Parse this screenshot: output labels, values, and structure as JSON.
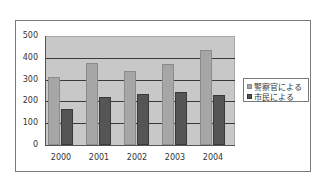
{
  "chart_data": {
    "type": "bar",
    "title": "",
    "xlabel": "",
    "ylabel": "",
    "categories": [
      "2000",
      "2001",
      "2002",
      "2003",
      "2004"
    ],
    "series": [
      {
        "name": "警察官による",
        "color": "#a6a6a6",
        "values": [
          310,
          375,
          340,
          373,
          435
        ]
      },
      {
        "name": "市民による",
        "color": "#555555",
        "values": [
          165,
          222,
          233,
          245,
          230
        ]
      }
    ],
    "ylim": [
      0,
      500
    ],
    "yticks": [
      "0",
      "100",
      "200",
      "300",
      "400",
      "500"
    ],
    "grid": true,
    "legend_position": "right",
    "plot_background": "#c8c8c8"
  },
  "legend": {
    "items": [
      {
        "label": "警察官による"
      },
      {
        "label": "市民による"
      }
    ]
  }
}
